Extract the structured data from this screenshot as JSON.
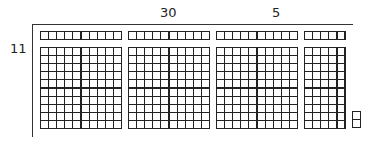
{
  "diagram": {
    "type": "area-model",
    "labels": {
      "top_tens": "30",
      "top_ones": "5",
      "left": "11"
    },
    "blocks": [
      {
        "name": "strip-1",
        "x": 40,
        "y": 31,
        "cols": 10,
        "rows": 1
      },
      {
        "name": "strip-2",
        "x": 128,
        "y": 31,
        "cols": 10,
        "rows": 1
      },
      {
        "name": "strip-3",
        "x": 216,
        "y": 31,
        "cols": 10,
        "rows": 1
      },
      {
        "name": "strip-4",
        "x": 304,
        "y": 31,
        "cols": 5,
        "rows": 1
      },
      {
        "name": "hundred-1",
        "x": 40,
        "y": 47,
        "cols": 10,
        "rows": 10
      },
      {
        "name": "hundred-2",
        "x": 128,
        "y": 47,
        "cols": 10,
        "rows": 10
      },
      {
        "name": "hundred-3",
        "x": 216,
        "y": 47,
        "cols": 10,
        "rows": 10
      },
      {
        "name": "fifty",
        "x": 304,
        "y": 47,
        "cols": 5,
        "rows": 10
      },
      {
        "name": "units",
        "x": 352,
        "y": 111,
        "cols": 1,
        "rows": 2
      }
    ]
  }
}
